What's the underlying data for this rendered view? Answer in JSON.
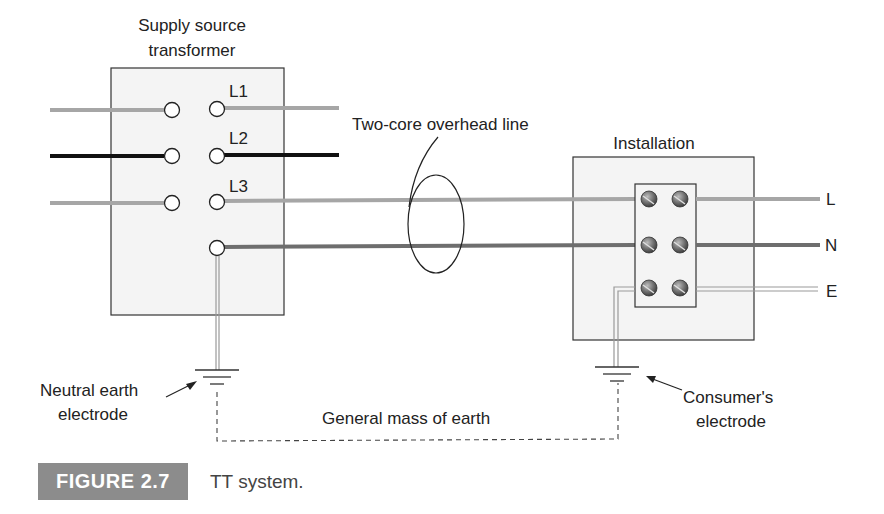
{
  "diagram": {
    "title": "TT system",
    "labels": {
      "supply_line1": "Supply source",
      "supply_line2": "transformer",
      "l1": "L1",
      "l2": "L2",
      "l3": "L3",
      "overhead_line": "Two-core overhead line",
      "installation": "Installation",
      "out_l": "L",
      "out_n": "N",
      "out_e": "E",
      "neutral_electrode_line1": "Neutral earth",
      "neutral_electrode_line2": "electrode",
      "consumer_electrode_line1": "Consumer's",
      "consumer_electrode_line2": "electrode",
      "mass_of_earth": "General mass of earth"
    },
    "colors": {
      "phase_grey": "#a6a6a6",
      "phase_black": "#111111",
      "neutral_dark": "#6e6e6e",
      "box_fill": "#f4f4f4",
      "badge_bg": "#8c8c8c"
    }
  },
  "caption": {
    "figure_label": "FIGURE 2.7",
    "text": "TT system."
  }
}
